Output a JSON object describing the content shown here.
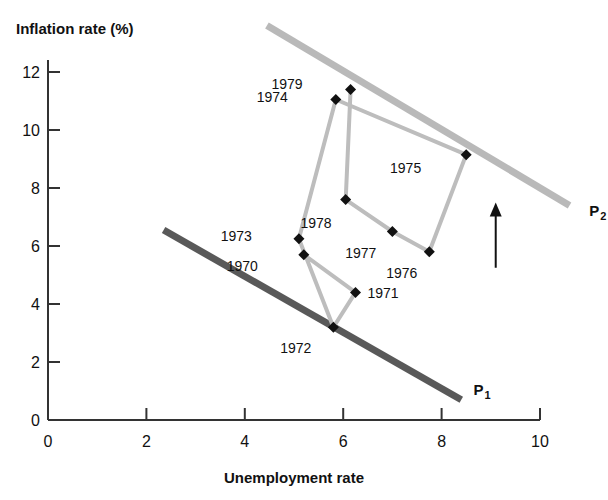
{
  "chart_data": {
    "type": "scatter",
    "title": "",
    "xlabel": "Unemployment rate",
    "ylabel": "Inflation rate (%)",
    "xlim": [
      0,
      10
    ],
    "ylim": [
      0,
      13
    ],
    "grid": false,
    "legend": "none",
    "xticks": [
      "0",
      "2",
      "4",
      "6",
      "8",
      "10"
    ],
    "xtick_values": [
      0,
      2,
      4,
      6,
      8,
      10
    ],
    "yticks": [
      "0",
      "2",
      "4",
      "6",
      "8",
      "10",
      "12"
    ],
    "ytick_values": [
      0,
      2,
      4,
      6,
      8,
      10,
      12
    ],
    "points": [
      {
        "label": "1970",
        "x": 5.2,
        "y": 5.7,
        "label_dx": -46,
        "label_dy": 16
      },
      {
        "label": "1971",
        "x": 6.25,
        "y": 4.4,
        "label_dx": 12,
        "label_dy": 6
      },
      {
        "label": "1972",
        "x": 5.8,
        "y": 3.2,
        "label_dx": -22,
        "label_dy": 26
      },
      {
        "label": "1973",
        "x": 5.1,
        "y": 6.25,
        "label_dx": -47,
        "label_dy": 2
      },
      {
        "label": "1974",
        "x": 5.85,
        "y": 11.05,
        "label_dx": -48,
        "label_dy": 2
      },
      {
        "label": "1975",
        "x": 8.5,
        "y": 9.15,
        "label_dx": -45,
        "label_dy": 18
      },
      {
        "label": "1976",
        "x": 7.75,
        "y": 5.8,
        "label_dx": -12,
        "label_dy": 26
      },
      {
        "label": "1977",
        "x": 7.0,
        "y": 6.5,
        "label_dx": -16,
        "label_dy": 26
      },
      {
        "label": "1978",
        "x": 6.05,
        "y": 7.6,
        "label_dx": -14,
        "label_dy": 28
      },
      {
        "label": "1979",
        "x": 6.15,
        "y": 11.4,
        "label_dx": -48,
        "label_dy": 0
      }
    ],
    "path_order": [
      "1970",
      "1971",
      "1972",
      "1973",
      "1974",
      "1975",
      "1976",
      "1977",
      "1978",
      "1979"
    ],
    "curves": [
      {
        "name": "P1",
        "base": "P",
        "sub": "1",
        "color": "#595959",
        "x0": 2.35,
        "y0": 6.55,
        "x1": 8.4,
        "y1": 0.7,
        "label_x": 8.65,
        "label_y": 0.85
      },
      {
        "name": "P2",
        "base": "P",
        "sub": "2",
        "color": "#b9b9b9",
        "x0": 4.45,
        "y0": 13.6,
        "x1": 10.6,
        "y1": 7.4,
        "label_x": 11.0,
        "label_y": 7.05
      }
    ],
    "arrow": {
      "name": "shift-arrow",
      "x": 9.1,
      "y_start": 5.25,
      "y_end": 7.5
    },
    "series_color": "#bdbdbd",
    "marker_color": "#111111",
    "axis_color": "#333333"
  }
}
